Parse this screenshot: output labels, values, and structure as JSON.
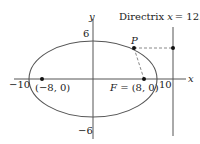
{
  "diagram": {
    "type": "ellipse-with-focus-directrix",
    "axes": {
      "x_label": "x",
      "y_label": "y",
      "x_ticks": [
        {
          "value": -10,
          "label": "−10"
        },
        {
          "value": 10,
          "label": "10"
        }
      ],
      "y_ticks": [
        {
          "value": 6,
          "label": "6"
        },
        {
          "value": -6,
          "label": "−6"
        }
      ]
    },
    "ellipse": {
      "center": [
        0,
        0
      ],
      "a": 10,
      "b": 6
    },
    "points": {
      "left_focus": {
        "coords": [
          -8,
          0
        ],
        "label": "(−8, 0)"
      },
      "right_focus": {
        "coords": [
          8,
          0
        ],
        "label_prefix": "F",
        "label": "F = (8, 0)"
      },
      "P": {
        "label": "P"
      }
    },
    "directrix": {
      "x": 12.5,
      "label_text": "Directrix",
      "label_eq": "x = 12.5",
      "label_var": "x",
      "label_value": "= 12.5"
    },
    "colors": {
      "stroke": "#555555",
      "dash": "#888888",
      "point": "#111111",
      "text": "#222222"
    }
  }
}
